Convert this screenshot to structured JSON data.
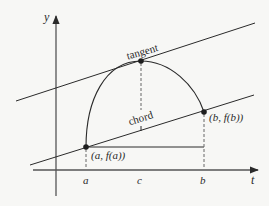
{
  "figure": {
    "colors": {
      "background": "#f7f7f5",
      "ink": "#2a2a2a",
      "axis": "#555555",
      "dashed": "#666666"
    },
    "axes": {
      "y_label": "y",
      "x_label": "t"
    },
    "ticks": {
      "a": "a",
      "c": "c",
      "b": "b"
    },
    "labels": {
      "tangent": "tangent",
      "chord": "chord",
      "point_a": "(a, f(a))",
      "point_b": "(b, f(b))"
    }
  }
}
